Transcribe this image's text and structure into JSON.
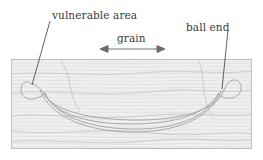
{
  "figure": {
    "background_color": "#ffffff",
    "labels": {
      "vulnerable_area": "vulnerable area",
      "ball_end": "ball end",
      "grain": "grain"
    },
    "icons": {
      "grain_arrow": "double-headed-arrow-icon",
      "leader_left": "leader-line-icon",
      "leader_right": "leader-line-icon"
    },
    "colors": {
      "wood_fill": "#eeeeee",
      "wood_border": "#b8b8b8",
      "grain_line": "#d9d9d9",
      "outline": "#9a9a9a",
      "leader_line": "#555555",
      "text": "#3a3a3a",
      "arrow": "#6d6d6d"
    },
    "block": {
      "x": 11,
      "y": 59,
      "width": 241,
      "height": 90
    },
    "grain_arrow": {
      "x1": 101,
      "x2": 164,
      "y": 49
    },
    "leader_lines": [
      {
        "name": "vulnerable-area-leader",
        "x1": 50,
        "y1": 21,
        "x2": 32,
        "y2": 85
      },
      {
        "name": "ball-end-leader",
        "x1": 228,
        "y1": 30,
        "x2": 222,
        "y2": 89
      }
    ],
    "shape": {
      "name": "ball-end-route-outline",
      "description": "crescent outline with bulbous rounded ends spanning the block"
    }
  }
}
